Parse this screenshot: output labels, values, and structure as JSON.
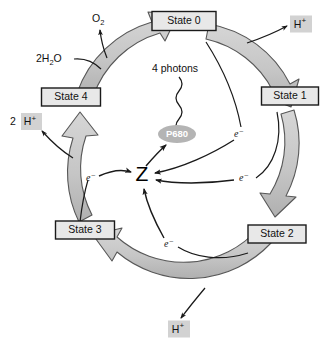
{
  "diagram": {
    "colors": {
      "ring_fill": "#c9c9c9",
      "ring_stroke": "#4a4a4a",
      "box_fill": "#e8e8e8",
      "box_stroke": "#1a1a1a",
      "badge_fill": "#d2d2d2",
      "p680_fill": "#b4b4b4",
      "text": "#111111",
      "arrow": "#1a1a1a",
      "background": "#ffffff"
    },
    "states": [
      {
        "id": "state-0",
        "label": "State 0",
        "x": 184,
        "y": 21,
        "w": 64,
        "h": 19
      },
      {
        "id": "state-1",
        "label": "State 1",
        "x": 290,
        "y": 96,
        "w": 57,
        "h": 18
      },
      {
        "id": "state-2",
        "label": "State 2",
        "x": 277,
        "y": 234,
        "w": 58,
        "h": 18
      },
      {
        "id": "state-3",
        "label": "State 3",
        "x": 85,
        "y": 230,
        "w": 59,
        "h": 18
      },
      {
        "id": "state-4",
        "label": "State 4",
        "x": 71,
        "y": 97,
        "w": 59,
        "h": 18
      }
    ],
    "badges": [
      {
        "id": "h-plus-top-right",
        "label": "H",
        "charge": "+",
        "prefix": "",
        "x": 301,
        "y": 24,
        "w": 22,
        "h": 17
      },
      {
        "id": "h-plus-left",
        "label": "H",
        "charge": "+",
        "prefix": "2 ",
        "x": 28,
        "y": 121,
        "w": 21,
        "h": 17
      },
      {
        "id": "h-plus-bottom",
        "label": "H",
        "charge": "+",
        "prefix": "",
        "x": 179,
        "y": 329,
        "w": 22,
        "h": 17
      }
    ],
    "molecules": [
      {
        "id": "oxygen",
        "text": "O",
        "sub": "2",
        "x": 92,
        "y": 18
      },
      {
        "id": "water",
        "text": "2H",
        "sub": "2",
        "tail": "O",
        "x": 36,
        "y": 60
      }
    ],
    "photons": {
      "label": "4 photons",
      "x": 179,
      "y": 69
    },
    "p680": {
      "label": "P680",
      "cx": 177,
      "cy": 134,
      "rx": 19,
      "ry": 9
    },
    "acceptor": {
      "label": "Z",
      "x": 142,
      "y": 175
    },
    "electrons": [
      {
        "id": "electron-from-state-3",
        "label": "e",
        "charge": "−",
        "x": 91,
        "y": 178
      },
      {
        "id": "electron-from-state-0",
        "label": "e",
        "charge": "−",
        "x": 239,
        "y": 134
      },
      {
        "id": "electron-from-state-1",
        "label": "e",
        "charge": "−",
        "x": 244,
        "y": 178
      },
      {
        "id": "electron-from-state-2",
        "label": "e",
        "charge": "−",
        "x": 169,
        "y": 244
      }
    ]
  }
}
